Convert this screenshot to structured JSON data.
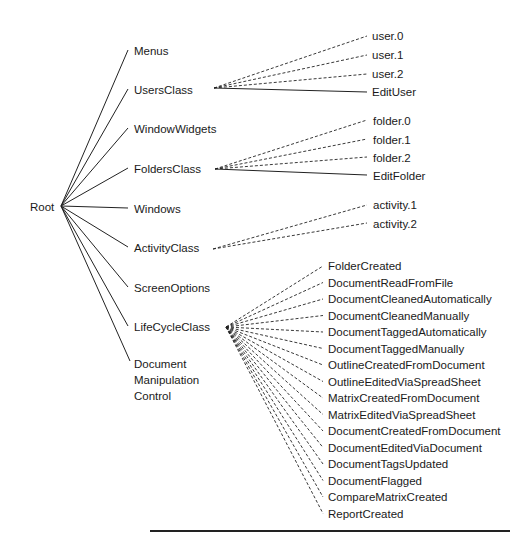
{
  "root": {
    "label": "Root"
  },
  "level1": [
    {
      "id": "menus",
      "label": "Menus"
    },
    {
      "id": "users-class",
      "label": "UsersClass"
    },
    {
      "id": "window-widgets",
      "label": "WindowWidgets"
    },
    {
      "id": "folders-class",
      "label": "FoldersClass"
    },
    {
      "id": "windows",
      "label": "Windows"
    },
    {
      "id": "activity-class",
      "label": "ActivityClass"
    },
    {
      "id": "screen-options",
      "label": "ScreenOptions"
    },
    {
      "id": "lifecycle-class",
      "label": "LifeCycleClass"
    },
    {
      "id": "document-manipulation-control",
      "label": "Document\nManipulation\nControl"
    }
  ],
  "users_children": [
    {
      "label": "user.0",
      "edge": "dashed"
    },
    {
      "label": "user.1",
      "edge": "dashed"
    },
    {
      "label": "user.2",
      "edge": "dashed"
    },
    {
      "label": "EditUser",
      "edge": "solid"
    }
  ],
  "folders_children": [
    {
      "label": "folder.0",
      "edge": "dashed"
    },
    {
      "label": "folder.1",
      "edge": "dashed"
    },
    {
      "label": "folder.2",
      "edge": "dashed"
    },
    {
      "label": "EditFolder",
      "edge": "solid"
    }
  ],
  "activity_children": [
    {
      "label": "activity.1",
      "edge": "dashed"
    },
    {
      "label": "activity.2",
      "edge": "dashed"
    }
  ],
  "lifecycle_children": [
    {
      "label": "FolderCreated"
    },
    {
      "label": "DocumentReadFromFile"
    },
    {
      "label": "DocumentCleanedAutomatically"
    },
    {
      "label": "DocumentCleanedManually"
    },
    {
      "label": "DocumentTaggedAutomatically"
    },
    {
      "label": "DocumentTaggedManually"
    },
    {
      "label": "OutlineCreatedFromDocument"
    },
    {
      "label": "OutlineEditedViaSpreadSheet"
    },
    {
      "label": "MatrixCreatedFromDocument"
    },
    {
      "label": "MatrixEditedViaSpreadSheet"
    },
    {
      "label": "DocumentCreatedFromDocument"
    },
    {
      "label": "DocumentEditedViaDocument"
    },
    {
      "label": "DocumentTagsUpdated"
    },
    {
      "label": "DocumentFlagged"
    },
    {
      "label": "CompareMatrixCreated"
    },
    {
      "label": "ReportCreated"
    }
  ],
  "colors": {
    "line": "#222222",
    "text": "#1a1a1a",
    "background": "#ffffff"
  }
}
